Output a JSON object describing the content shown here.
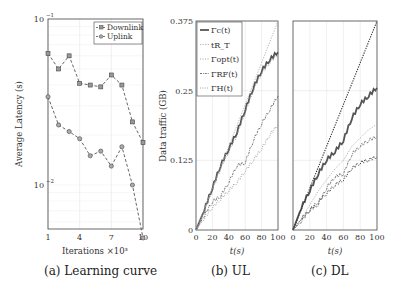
{
  "captions": {
    "a": "(a) Learning curve",
    "b": "(b) UL",
    "c": "(c) DL"
  },
  "axes_labels": {
    "a_x": "Iterations ×10³",
    "a_y": "Average Latency (s)",
    "b_x": "t(s)",
    "b_y": "Data traffic (GB)",
    "c_x": "t(s)"
  },
  "chart_data": [
    {
      "type": "line",
      "title": "(a) Learning curve",
      "xlabel": "Iterations ×10³",
      "ylabel": "Average Latency (s)",
      "yscale": "log",
      "ylim": [
        0.0045,
        0.1
      ],
      "xlim": [
        1,
        10
      ],
      "x_ticks": [
        "1",
        "4",
        "7",
        "10"
      ],
      "y_ticks": [
        "10^-1",
        "10^-2"
      ],
      "grid": true,
      "legend_position": "upper right",
      "x": [
        1,
        2,
        3,
        4,
        5,
        6,
        7,
        8,
        9,
        10
      ],
      "series": [
        {
          "name": "Downlink",
          "marker": "square",
          "values": [
            0.062,
            0.05,
            0.06,
            0.041,
            0.04,
            0.039,
            0.046,
            0.04,
            0.024,
            0.018
          ]
        },
        {
          "name": "Uplink",
          "marker": "circle",
          "values": [
            0.034,
            0.023,
            0.021,
            0.019,
            0.015,
            0.016,
            0.013,
            0.017,
            0.01,
            0.0048
          ]
        }
      ]
    },
    {
      "type": "line",
      "title": "(b) UL",
      "xlabel": "t(s)",
      "ylabel": "Data traffic (GB)",
      "xlim": [
        0,
        100
      ],
      "ylim": [
        0,
        0.375
      ],
      "x_ticks": [
        "0",
        "20",
        "40",
        "60",
        "80",
        "100"
      ],
      "y_ticks": [
        "0",
        "0.125",
        "0.25",
        "0.375"
      ],
      "grid": true,
      "legend_position": "upper left",
      "x": [
        0,
        10,
        20,
        30,
        40,
        50,
        60,
        70,
        80,
        90,
        100
      ],
      "series": [
        {
          "name": "Γc(t)",
          "style": "solid-thick",
          "values": [
            0,
            0.035,
            0.075,
            0.115,
            0.145,
            0.175,
            0.215,
            0.255,
            0.285,
            0.305,
            0.319
          ]
        },
        {
          "name": "tR_T",
          "style": "dotted-light",
          "values": [
            0,
            0.0375,
            0.075,
            0.1125,
            0.15,
            0.1875,
            0.225,
            0.2625,
            0.3,
            0.3375,
            0.375
          ]
        },
        {
          "name": "Γopt(t)",
          "style": "dotted",
          "values": [
            0,
            0.033,
            0.07,
            0.11,
            0.14,
            0.17,
            0.21,
            0.25,
            0.28,
            0.3,
            0.315
          ]
        },
        {
          "name": "ΓRF(t)",
          "style": "dash-dot",
          "values": [
            0,
            0.025,
            0.05,
            0.06,
            0.085,
            0.115,
            0.12,
            0.16,
            0.19,
            0.215,
            0.24
          ]
        },
        {
          "name": "ΓH(t)",
          "style": "dotted-gray",
          "values": [
            0,
            0.02,
            0.04,
            0.055,
            0.07,
            0.085,
            0.105,
            0.125,
            0.145,
            0.17,
            0.188
          ]
        }
      ]
    },
    {
      "type": "line",
      "title": "(c) DL",
      "xlabel": "t(s)",
      "ylabel": "Data traffic (GB)",
      "xlim": [
        0,
        100
      ],
      "ylim": [
        0,
        0.375
      ],
      "x_ticks": [
        "0",
        "20",
        "40",
        "60",
        "80",
        "100"
      ],
      "grid": true,
      "x": [
        0,
        10,
        20,
        30,
        40,
        50,
        60,
        70,
        80,
        90,
        100
      ],
      "series": [
        {
          "name": "Γc(t)",
          "style": "solid-thick",
          "values": [
            0,
            0.04,
            0.07,
            0.1,
            0.125,
            0.14,
            0.16,
            0.2,
            0.225,
            0.24,
            0.255
          ]
        },
        {
          "name": "tR_T",
          "style": "dotted-black",
          "values": [
            0,
            0.0375,
            0.075,
            0.1125,
            0.15,
            0.1875,
            0.225,
            0.2625,
            0.3,
            0.3375,
            0.375
          ]
        },
        {
          "name": "Γopt(t)",
          "style": "dotted-light",
          "values": [
            0,
            0.02,
            0.045,
            0.07,
            0.09,
            0.11,
            0.125,
            0.15,
            0.165,
            0.18,
            0.19
          ]
        },
        {
          "name": "ΓRF(t)",
          "style": "dash-dot",
          "values": [
            0,
            0.015,
            0.035,
            0.045,
            0.075,
            0.095,
            0.1,
            0.135,
            0.15,
            0.16,
            0.167
          ]
        },
        {
          "name": "ΓH(t)",
          "style": "dotted-dark",
          "values": [
            0,
            0.02,
            0.035,
            0.05,
            0.065,
            0.08,
            0.09,
            0.11,
            0.12,
            0.125,
            0.131
          ]
        }
      ]
    }
  ]
}
